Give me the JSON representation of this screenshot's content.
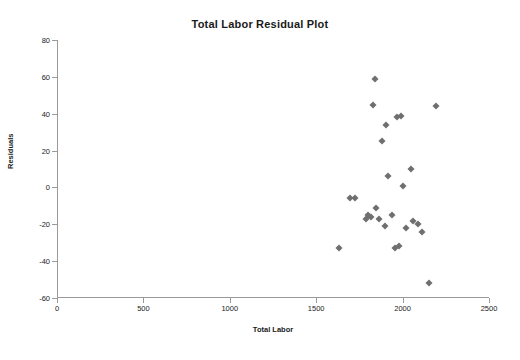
{
  "chart_data": {
    "type": "scatter",
    "title": "Total Labor Residual Plot",
    "xlabel": "Total Labor",
    "ylabel": "Residuals",
    "xlim": [
      0,
      2500
    ],
    "ylim": [
      -60,
      80
    ],
    "xticks": [
      0,
      500,
      1000,
      1500,
      2000,
      2500
    ],
    "yticks": [
      -60,
      -40,
      -20,
      0,
      20,
      40,
      60,
      80
    ],
    "grid": false,
    "legend": "none",
    "marker": "diamond",
    "marker_color": "#6f6f6f",
    "points": [
      {
        "x": 1633,
        "y": -33
      },
      {
        "x": 1697,
        "y": -6
      },
      {
        "x": 1722,
        "y": -6
      },
      {
        "x": 1788,
        "y": -17
      },
      {
        "x": 1800,
        "y": -15
      },
      {
        "x": 1818,
        "y": -16
      },
      {
        "x": 1826,
        "y": 45
      },
      {
        "x": 1838,
        "y": 59
      },
      {
        "x": 1848,
        "y": -11
      },
      {
        "x": 1862,
        "y": -17
      },
      {
        "x": 1880,
        "y": 25
      },
      {
        "x": 1896,
        "y": -21
      },
      {
        "x": 1902,
        "y": 34
      },
      {
        "x": 1918,
        "y": 6
      },
      {
        "x": 1938,
        "y": -15
      },
      {
        "x": 1955,
        "y": -33
      },
      {
        "x": 1966,
        "y": 38
      },
      {
        "x": 1978,
        "y": -32
      },
      {
        "x": 1992,
        "y": 39
      },
      {
        "x": 2000,
        "y": 1
      },
      {
        "x": 2018,
        "y": -22
      },
      {
        "x": 2046,
        "y": 10
      },
      {
        "x": 2062,
        "y": -18
      },
      {
        "x": 2090,
        "y": -20
      },
      {
        "x": 2112,
        "y": -24
      },
      {
        "x": 2152,
        "y": -52
      },
      {
        "x": 2196,
        "y": 44
      }
    ]
  }
}
